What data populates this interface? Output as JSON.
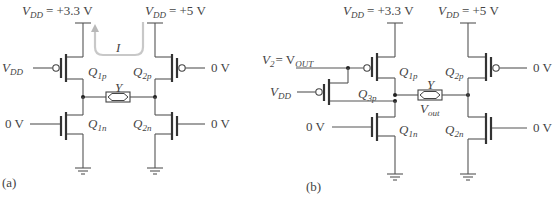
{
  "panel_a": {
    "caption": "(a)",
    "supply_left": {
      "var": "V",
      "sub": "DD",
      "value": "= +3.3 V"
    },
    "supply_right": {
      "var": "V",
      "sub": "DD",
      "value": "= +5 V"
    },
    "current_label": "I",
    "input_left_top": {
      "var": "V",
      "sub": "DD"
    },
    "input_right_top": "0 V",
    "input_left_bottom": "0 V",
    "input_right_bottom": "0 V",
    "line_label": "Y",
    "transistors": [
      {
        "q": "Q",
        "sub": "1p"
      },
      {
        "q": "Q",
        "sub": "2p"
      },
      {
        "q": "Q",
        "sub": "1n"
      },
      {
        "q": "Q",
        "sub": "2n"
      }
    ]
  },
  "panel_b": {
    "caption": "(b)",
    "supply_left": {
      "var": "V",
      "sub": "DD",
      "value": "= +3.3 V"
    },
    "supply_right": {
      "var": "V",
      "sub": "DD",
      "value": "= +5 V"
    },
    "input_v2": {
      "var": "V",
      "sub2": "2",
      "eq": "= V",
      "sub": "OUT"
    },
    "input_vdd": {
      "var": "V",
      "sub": "DD"
    },
    "input_left_bottom": "0 V",
    "input_right_top": "0 V",
    "input_right_bottom": "0 V",
    "line_label": "Y",
    "vout": {
      "var": "V",
      "sub": "out"
    },
    "transistors": [
      {
        "q": "Q",
        "sub": "1p"
      },
      {
        "q": "Q",
        "sub": "2p"
      },
      {
        "q": "Q",
        "sub": "3p"
      },
      {
        "q": "Q",
        "sub": "1n"
      },
      {
        "q": "Q",
        "sub": "2n"
      }
    ]
  },
  "colors": {
    "wire": "#555555",
    "current_arrow": "#c8c8c8",
    "text": "#444444"
  }
}
